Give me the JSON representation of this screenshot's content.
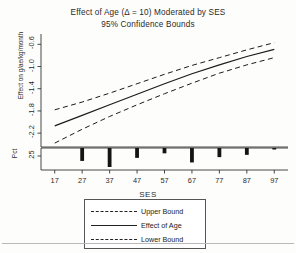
{
  "chart_data": {
    "type": "line",
    "title": "Effect of Age (Δ = 10) Moderated by SES",
    "subtitle": "95% Confidence Bounds",
    "xlabel": "SES",
    "ylabel": "Effect on g/ae/kg/month",
    "secondary_ylabel": "Pct",
    "xlim": [
      12,
      102
    ],
    "ylim": [
      -2.45,
      -0.45
    ],
    "xticks": [
      17,
      27,
      37,
      47,
      57,
      67,
      77,
      87,
      97
    ],
    "yticks": [
      -0.6,
      -1.0,
      -1.4,
      -1.8,
      -2.2
    ],
    "ytick_labels": [
      "-0.6",
      "-1.0",
      "-1.4",
      "-1.8",
      "-2.2"
    ],
    "secondary_yticks": [
      25
    ],
    "secondary_ytick_labels": [
      "25"
    ],
    "grid": false,
    "legend_position": "bottom-center",
    "x": [
      17,
      27,
      37,
      47,
      57,
      67,
      77,
      87,
      97
    ],
    "series": [
      {
        "name": "Upper Bound",
        "style": "dashed",
        "values": [
          -1.78,
          -1.64,
          -1.48,
          -1.31,
          -1.14,
          -0.98,
          -0.84,
          -0.7,
          -0.57
        ]
      },
      {
        "name": "Effect of Age",
        "style": "solid",
        "values": [
          -2.07,
          -1.88,
          -1.69,
          -1.5,
          -1.31,
          -1.13,
          -0.97,
          -0.82,
          -0.69
        ]
      },
      {
        "name": "Lower Bound",
        "style": "dashed",
        "values": [
          -2.38,
          -2.13,
          -1.9,
          -1.69,
          -1.49,
          -1.3,
          -1.12,
          -0.97,
          -0.84
        ]
      }
    ],
    "histogram": {
      "orientation": "hanging",
      "axis_label": "Pct",
      "categories": [
        17,
        27,
        37,
        47,
        57,
        67,
        77,
        87,
        97
      ],
      "values": [
        0,
        17,
        25,
        13,
        7,
        19,
        12,
        9,
        2
      ]
    }
  },
  "legend": {
    "items": [
      {
        "label": "Upper Bound",
        "style": "dashed"
      },
      {
        "label": "Effect of Age",
        "style": "solid"
      },
      {
        "label": "Lower Bound",
        "style": "dashed"
      }
    ]
  }
}
